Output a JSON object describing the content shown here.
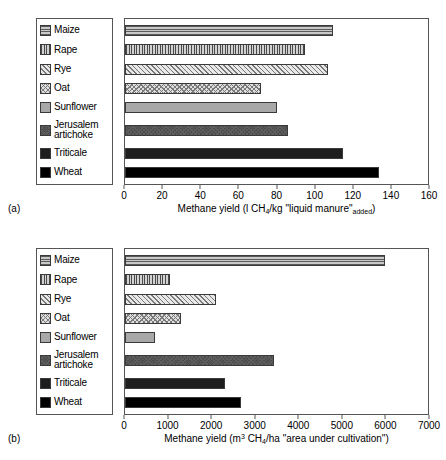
{
  "figure": {
    "panels": [
      {
        "tag": "(a)",
        "axis_title_html": "Methane yield (l CH<sub>4</sub>/kg \"liquid manure\"<sub>added</sub>)"
      },
      {
        "tag": "(b)",
        "axis_title_html": "Methane yield (m<sup>3</sup> CH<sub>4</sub>/ha \"area under cultivation\")"
      }
    ]
  },
  "legend": {
    "items": [
      {
        "label": "Maize",
        "pattern": "horizontal-lines",
        "swatch_class": "fill-hlines"
      },
      {
        "label": "Rape",
        "pattern": "vertical-lines",
        "swatch_class": "fill-vlines"
      },
      {
        "label": "Rye",
        "pattern": "diagonal-hatch",
        "swatch_class": "fill-diag"
      },
      {
        "label": "Oat",
        "pattern": "crosshatch",
        "swatch_class": "fill-cross"
      },
      {
        "label": "Sunflower",
        "pattern": "solid-light-gray",
        "swatch_class": "fill-lightgray"
      },
      {
        "label": "Jerusalem\nartichoke",
        "pattern": "dark-gray-crosshatch",
        "swatch_class": "fill-darkgray"
      },
      {
        "label": "Triticale",
        "pattern": "very-dark-gray",
        "swatch_class": "fill-verydark"
      },
      {
        "label": "Wheat",
        "pattern": "solid-black",
        "swatch_class": "fill-black"
      }
    ]
  },
  "colors": {
    "axis": "#555555",
    "background": "#ffffff",
    "text": "#000000"
  },
  "chart_data": [
    {
      "type": "bar",
      "orientation": "horizontal",
      "panel": "(a)",
      "title": "",
      "xlabel": "Methane yield (l CH4/kg \"liquid manure\"added)",
      "ylabel": "",
      "categories": [
        "Maize",
        "Rape",
        "Rye",
        "Oat",
        "Sunflower",
        "Jerusalem artichoke",
        "Triticale",
        "Wheat"
      ],
      "values": [
        110,
        95,
        107,
        72,
        80,
        86,
        115,
        134
      ],
      "xlim": [
        0,
        160
      ],
      "xticks": [
        0,
        20,
        40,
        60,
        80,
        100,
        120,
        140,
        160
      ],
      "grid": false,
      "legend_position": "left-outside"
    },
    {
      "type": "bar",
      "orientation": "horizontal",
      "panel": "(b)",
      "title": "",
      "xlabel": "Methane yield (m3 CH4/ha \"area under cultivation\")",
      "ylabel": "",
      "categories": [
        "Maize",
        "Rape",
        "Rye",
        "Oat",
        "Sunflower",
        "Jerusalem artichoke",
        "Triticale",
        "Wheat"
      ],
      "values": [
        6000,
        1050,
        2100,
        1300,
        700,
        3450,
        2300,
        2680
      ],
      "xlim": [
        0,
        7000
      ],
      "xticks": [
        0,
        1000,
        2000,
        3000,
        4000,
        5000,
        6000,
        7000
      ],
      "grid": false,
      "legend_position": "left-outside"
    }
  ]
}
